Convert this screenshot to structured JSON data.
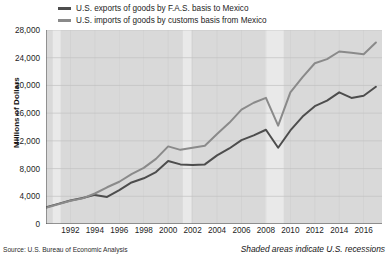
{
  "legend": {
    "items": [
      {
        "label": "U.S. exports of goods by F.A.S. basis to Mexico",
        "color": "#4d4d4d",
        "name": "exports"
      },
      {
        "label": "U.S. imports of goods by customs basis from Mexico",
        "color": "#8a8a8a",
        "name": "imports"
      }
    ]
  },
  "axes": {
    "ylabel": "Millions of Dollars",
    "yticks": [
      "0",
      "4,000",
      "8,000",
      "12,000",
      "16,000",
      "20,000",
      "24,000",
      "28,000"
    ],
    "xticks": [
      "1992",
      "1994",
      "1996",
      "1998",
      "2000",
      "2002",
      "2004",
      "2006",
      "2008",
      "2010",
      "2012",
      "2014",
      "2016"
    ]
  },
  "notes": {
    "source": "Source: U.S. Bureau of Economic Analysis",
    "recession": "Shaded areas indicate U.S. recessions"
  },
  "colors": {
    "plot_background": "#d9d9d9",
    "recession_band": "#e9e9e9",
    "gridline": "#c2c2c2",
    "axis": "#4a4a4a",
    "exports_line": "#4d4d4d",
    "imports_line": "#8a8a8a"
  },
  "chart_data": {
    "type": "line",
    "title": "",
    "xlabel": "",
    "ylabel": "Millions of Dollars",
    "xlim": [
      1990,
      2017.5
    ],
    "ylim": [
      0,
      28000
    ],
    "ytick_step": 4000,
    "grid": true,
    "legend_position": "top-left",
    "x": [
      1990,
      1991,
      1992,
      1993,
      1994,
      1995,
      1996,
      1997,
      1998,
      1999,
      2000,
      2001,
      2002,
      2003,
      2004,
      2005,
      2006,
      2007,
      2008,
      2009,
      2010,
      2011,
      2012,
      2013,
      2014,
      2015,
      2016,
      2017
    ],
    "series": [
      {
        "name": "U.S. exports of goods by F.A.S. basis to Mexico",
        "color": "#4d4d4d",
        "values": [
          2400,
          2900,
          3400,
          3750,
          4200,
          3900,
          4900,
          6000,
          6600,
          7500,
          9100,
          8600,
          8500,
          8600,
          9900,
          10900,
          12100,
          12800,
          13600,
          11000,
          13500,
          15500,
          17000,
          17800,
          19000,
          18200,
          18500,
          19800
        ]
      },
      {
        "name": "U.S. imports of goods by customs basis from Mexico",
        "color": "#8a8a8a",
        "values": [
          2350,
          2850,
          3350,
          3700,
          4400,
          5300,
          6100,
          7200,
          8100,
          9400,
          11200,
          10700,
          11000,
          11300,
          13000,
          14600,
          16500,
          17500,
          18200,
          14200,
          19000,
          21200,
          23200,
          23800,
          24900,
          24700,
          24500,
          26200
        ]
      }
    ],
    "recessions": [
      {
        "start": 1990.55,
        "end": 1991.2
      },
      {
        "start": 2001.2,
        "end": 2001.9
      },
      {
        "start": 2007.95,
        "end": 2009.45
      }
    ]
  }
}
